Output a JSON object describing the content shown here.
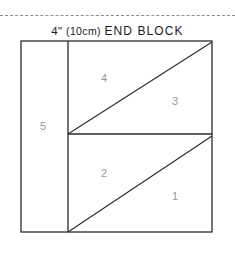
{
  "page": {
    "width": 235,
    "height": 253,
    "background": "#ffffff",
    "ink_color": "#2b2b2b",
    "label_color": "#9a9a9a",
    "dash_color": "#8d8d8d"
  },
  "dashed_rule": {
    "name": "cut-line",
    "y": 15,
    "x_start": 0,
    "x_end": 235
  },
  "title": {
    "full": "4\" (10cm) END BLOCK",
    "size": "4\"",
    "metric": "(10cm)",
    "name": "END BLOCK"
  },
  "block": {
    "outline": {
      "x1": 21,
      "y1": 41,
      "x2": 212,
      "y2": 232
    },
    "lines": [
      {
        "name": "vertical-divider",
        "x1": 68,
        "y1": 41,
        "x2": 68,
        "y2": 232
      },
      {
        "name": "horizontal-midline",
        "x1": 68,
        "y1": 134,
        "x2": 212,
        "y2": 134
      },
      {
        "name": "upper-diagonal",
        "x1": 68,
        "y1": 134,
        "x2": 212,
        "y2": 42
      },
      {
        "name": "lower-diagonal",
        "x1": 68,
        "y1": 232,
        "x2": 212,
        "y2": 136
      }
    ],
    "pieces": [
      {
        "number": "1",
        "x": 175,
        "y": 196
      },
      {
        "number": "2",
        "x": 104,
        "y": 173
      },
      {
        "number": "3",
        "x": 175,
        "y": 101
      },
      {
        "number": "4",
        "x": 104,
        "y": 78
      },
      {
        "number": "5",
        "x": 43,
        "y": 126
      }
    ]
  }
}
